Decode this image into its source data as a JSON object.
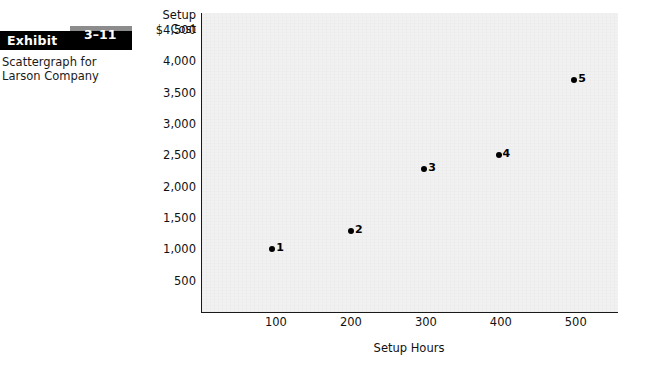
{
  "exhibit": {
    "word": "Exhibit",
    "number": "3–11",
    "caption": "Scattergraph for Larson Company"
  },
  "chart_data": {
    "type": "scatter",
    "title": "Scattergraph for Larson Company",
    "xlabel": "Setup Hours",
    "ylabel": "Setup Cost",
    "xlim": [
      0,
      555
    ],
    "ylim": [
      0,
      4770
    ],
    "grid": false,
    "legend": "none",
    "x_ticks": [
      "100",
      "200",
      "300",
      "400",
      "500"
    ],
    "x_tick_values": [
      100,
      200,
      300,
      400,
      500
    ],
    "y_ticks": [
      "$4,500",
      "4,000",
      "3,500",
      "3,000",
      "2,500",
      "2,000",
      "1,500",
      "1,000",
      "500"
    ],
    "y_tick_values": [
      4500,
      4000,
      3500,
      3000,
      2500,
      2000,
      1500,
      1000,
      500
    ],
    "points": [
      {
        "label": "1",
        "x": 95,
        "y": 1000
      },
      {
        "label": "2",
        "x": 200,
        "y": 1300
      },
      {
        "label": "3",
        "x": 298,
        "y": 2280
      },
      {
        "label": "4",
        "x": 397,
        "y": 2500
      },
      {
        "label": "5",
        "x": 498,
        "y": 3700
      }
    ],
    "colors": {
      "point": "#000000",
      "axis": "#1a1a1a",
      "plot_background": "#f1f1f1",
      "exhibit_bar": "#000000",
      "exhibit_number_box": "#8c8c8c"
    }
  }
}
